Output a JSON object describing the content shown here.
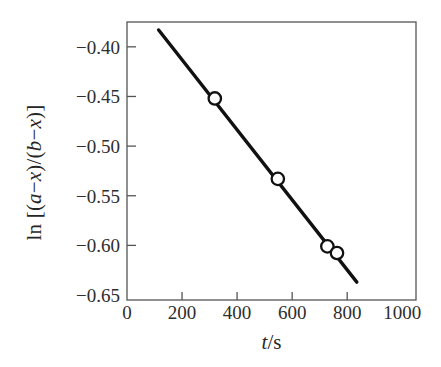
{
  "chart_data": {
    "type": "scatter",
    "title": "",
    "subtitle": "",
    "xlabel": "t/s",
    "xlabel_parts": {
      "italic": "t",
      "roman": "/s"
    },
    "ylabel": "ln [(a−x)/(b−x)]",
    "ylabel_parts": {
      "prefix": "ln [(",
      "a": "a",
      "minus1": "−",
      "x1": "x",
      "mid": ")/(",
      "b": "b",
      "minus2": "−",
      "x2": "x",
      "suffix": ")]"
    },
    "xlim": [
      0,
      1050
    ],
    "ylim": [
      -0.655,
      -0.375
    ],
    "xticks": [
      0,
      200,
      400,
      600,
      800,
      1000
    ],
    "xtick_labels": [
      "0",
      "200",
      "400",
      "600",
      "800",
      "1000"
    ],
    "yticks": [
      -0.4,
      -0.45,
      -0.5,
      -0.55,
      -0.6,
      -0.65
    ],
    "ytick_labels": [
      "−0.40",
      "−0.45",
      "−0.50",
      "−0.55",
      "−0.60",
      "−0.65"
    ],
    "grid": false,
    "legend": null,
    "series": [
      {
        "name": "ln[(a-x)/(b-x)] vs t",
        "marker": "open-circle",
        "marker_facecolor": "#ffffff",
        "marker_edgecolor": "#111111",
        "line_color": "#111111",
        "line_width": 3.4,
        "x": [
          177,
          319,
          548,
          728
        ],
        "y": [
          -0.403,
          -0.452,
          -0.533,
          -0.601
        ]
      }
    ],
    "fit_line": {
      "name": "best-fit straight line",
      "x_start": 115,
      "y_start": -0.383,
      "x_end": 835,
      "y_end": -0.637,
      "slope": -0.000353,
      "intercept": -0.3424,
      "color": "#111111"
    },
    "axes": {
      "frame_color": "#555555",
      "frame_width": 1.2,
      "tick_direction": "in",
      "background": "#ffffff"
    }
  },
  "figure": {
    "background_color": "#ffffff",
    "ink_color": "#222222"
  }
}
